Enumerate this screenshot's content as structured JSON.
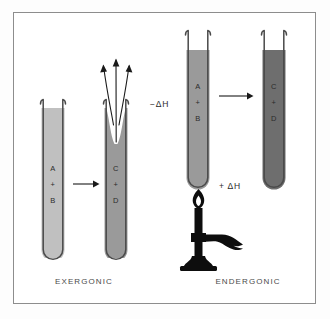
{
  "figure": {
    "background_color": "#ffffff",
    "frame_color": "#8d8d8d"
  },
  "colors": {
    "liquid_light": "#c0c0c0",
    "liquid_medium": "#9a9a9a",
    "liquid_dark": "#6e6e6e",
    "glass_outline": "#4a4a4a",
    "ink": "#1a1a1a",
    "text": "#2b2b2b"
  },
  "panels": [
    {
      "id": "exergonic",
      "caption": "EXERGONIC",
      "energy_label": "−ΔH",
      "tubes": [
        {
          "id": "exergonic-reactants",
          "lines": [
            "A",
            "+",
            "B"
          ],
          "fill": "light"
        },
        {
          "id": "exergonic-products",
          "lines": [
            "C",
            "+",
            "D"
          ],
          "fill": "medium"
        }
      ],
      "arrow": {
        "id": "reaction-arrow-left",
        "direction": "right"
      },
      "vapor_arrows": 3,
      "has_burner": false
    },
    {
      "id": "endergonic",
      "caption": "ENDERGONIC",
      "energy_label": "+ ΔH",
      "tubes": [
        {
          "id": "endergonic-reactants",
          "lines": [
            "A",
            "+",
            "B"
          ],
          "fill": "medium"
        },
        {
          "id": "endergonic-products",
          "lines": [
            "C",
            "+",
            "D"
          ],
          "fill": "dark"
        }
      ],
      "arrow": {
        "id": "reaction-arrow-right",
        "direction": "right"
      },
      "vapor_arrows": 0,
      "has_burner": true,
      "burner": {
        "id": "bunsen-burner",
        "parts": [
          "flame",
          "barrel",
          "collar",
          "hose",
          "base"
        ]
      }
    }
  ],
  "labels": {
    "tube1_a": "A",
    "tube1_plus": "+",
    "tube1_b": "B",
    "tube2_c": "C",
    "tube2_plus": "+",
    "tube2_d": "D",
    "tube3_a": "A",
    "tube3_plus": "+",
    "tube3_b": "B",
    "tube4_c": "C",
    "tube4_plus": "+",
    "tube4_d": "D",
    "minus_delta_h": "−ΔH",
    "plus_delta_h": "+ ΔH",
    "caption_left": "EXERGONIC",
    "caption_right": "ENDERGONIC"
  }
}
